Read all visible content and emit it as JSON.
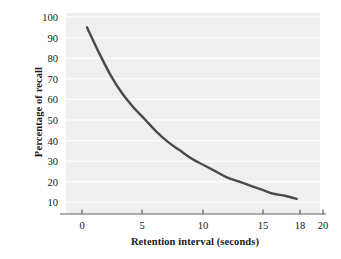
{
  "chart_data": {
    "type": "line",
    "title": "",
    "xlabel": "Retention interval (seconds)",
    "ylabel": "Percentage of recall",
    "xlim": [
      -1.8,
      20
    ],
    "ylim": [
      0,
      105
    ],
    "xticks": [
      0,
      5,
      10,
      15,
      18,
      20
    ],
    "xtick_labels": [
      "0",
      "5",
      "10",
      "15",
      "18",
      "20"
    ],
    "yticks": [
      10,
      20,
      30,
      40,
      50,
      60,
      70,
      80,
      90,
      100
    ],
    "ytick_labels": [
      "10",
      "20",
      "30",
      "40",
      "50",
      "60",
      "70",
      "80",
      "90",
      "100"
    ],
    "grid": "horizontal-white-gridlines",
    "legend": "none",
    "series": [
      {
        "name": "Percentage of recall",
        "color": "#4a4a4a",
        "line_width": 2.4,
        "x": [
          0,
          1,
          2,
          3,
          4,
          5,
          6,
          7,
          8,
          9,
          10,
          11,
          12,
          13,
          14,
          15,
          16,
          17,
          18
        ],
        "y": [
          95,
          83,
          72,
          63,
          56,
          50,
          44,
          39,
          35,
          31,
          28,
          25,
          22,
          20,
          18,
          16,
          14,
          13,
          11.5
        ]
      }
    ]
  },
  "axis": {
    "y_labels": [
      "100",
      "90",
      "80",
      "70",
      "60",
      "50",
      "40",
      "30",
      "20",
      "10"
    ],
    "x_labels": [
      "0",
      "5",
      "10",
      "15",
      "18",
      "20"
    ],
    "x_title": "Retention interval (seconds)",
    "y_title": "Percentage of recall"
  },
  "colors": {
    "panel_background": "#efefef",
    "gridline": "#fbfbfb",
    "curve": "#4a4a4a",
    "axis_line": "#5a5a5a",
    "text": "#141414",
    "page_background": "#ffffff"
  }
}
